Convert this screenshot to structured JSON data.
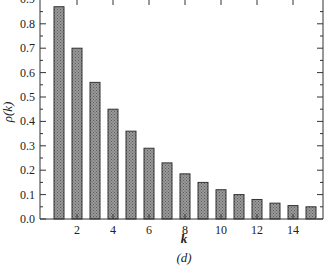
{
  "chart_data": {
    "type": "bar",
    "title": "",
    "caption": "(d)",
    "xlabel": "k",
    "ylabel": "ρ(k)",
    "categories": [
      1,
      2,
      3,
      4,
      5,
      6,
      7,
      8,
      9,
      10,
      11,
      12,
      13,
      14,
      15
    ],
    "values": [
      0.87,
      0.7,
      0.56,
      0.45,
      0.36,
      0.29,
      0.23,
      0.185,
      0.15,
      0.12,
      0.1,
      0.08,
      0.065,
      0.055,
      0.05
    ],
    "ylim": [
      0.0,
      0.9
    ],
    "xlim": [
      0,
      16
    ],
    "yticks": [
      "0.0",
      "0.1",
      "0.2",
      "0.3",
      "0.4",
      "0.5",
      "0.6",
      "0.7",
      "0.8",
      "0.9"
    ],
    "xticks": [
      "2",
      "4",
      "6",
      "8",
      "10",
      "12",
      "14"
    ],
    "grid": false,
    "legend": null,
    "bar_fill": "#8c8c8c",
    "bar_pattern": "crosshatch"
  }
}
